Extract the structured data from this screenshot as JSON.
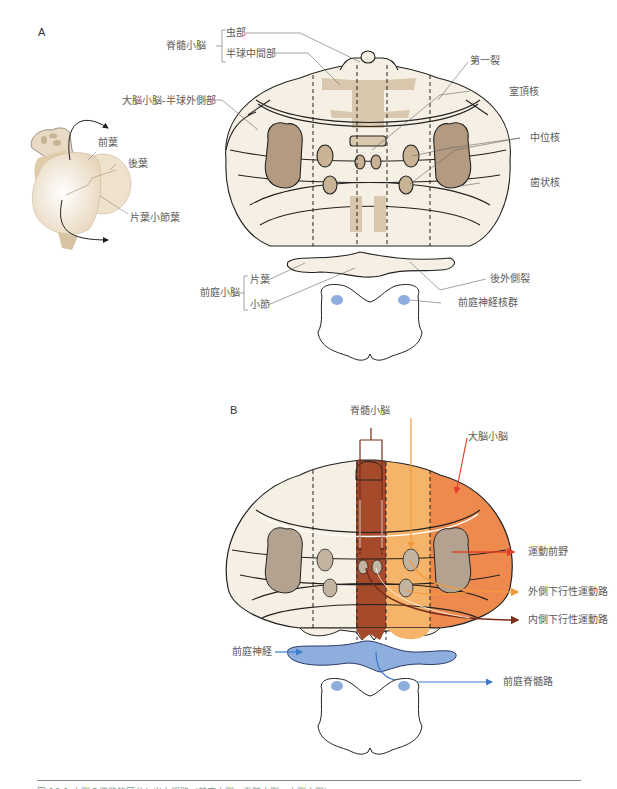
{
  "panels": {
    "a": {
      "letter": "A",
      "labels": {
        "spinocerebellum": "脊髄小脳",
        "vermis": "虫部",
        "intermediate_hemisphere": "半球中間部",
        "primary_fissure": "第一裂",
        "cerebrocerebellum_lateral": "大脳小脳-半球外側部",
        "fastigial_nucleus": "室頂核",
        "interposed_nucleus": "中位核",
        "dentate_nucleus": "歯状核",
        "anterior_lobe": "前葉",
        "posterior_lobe": "後葉",
        "flocculonodular_lobe": "片葉小節葉",
        "posterolateral_fissure": "後外側裂",
        "vestibulocerebellum": "前庭小脳",
        "flocculus": "片葉",
        "nodulus": "小節",
        "vestibular_nuclei": "前庭神経核群"
      }
    },
    "b": {
      "letter": "B",
      "labels": {
        "spinocerebellum": "脊髄小脳",
        "cerebrocerebellum": "大脳小脳",
        "premotor_cortex": "運動前野",
        "lateral_descending": "外側下行性運動路",
        "medial_descending": "内側下行性運動路",
        "vestibular_nerve": "前庭神経",
        "vestibulospinal_tract": "前庭脊髄路"
      }
    }
  },
  "colors": {
    "tissue": "#f6efe3",
    "nucleus": "#b39a80",
    "vermis_path": "#a64a2c",
    "intermediate_path": "#f5b46a",
    "lateral_path": "#ee8a4e",
    "vestibular_blue": "#8eaede",
    "outline": "#222222"
  },
  "caption": {
    "text": "図 18-1 小脳の機能的区分と出力経路（前庭小脳・脊髄小脳・大脳小脳）"
  }
}
